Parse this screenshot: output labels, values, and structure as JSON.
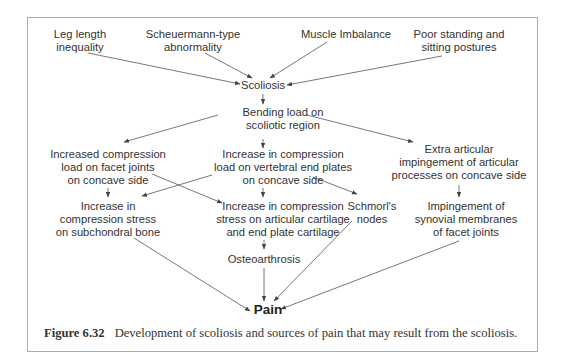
{
  "figure": {
    "caption_label": "Figure 6.32",
    "caption_text": "Development of scoliosis and sources of pain that may result from the scoliosis.",
    "border_color": "#a9a9cf",
    "text_color": "#333333"
  },
  "nodes": {
    "leg_length": [
      "Leg length",
      "inequality"
    ],
    "scheuermann": [
      "Scheuermann-type",
      "abnormality"
    ],
    "muscle_imbalance": [
      "Muscle Imbalance"
    ],
    "poor_posture": [
      "Poor standing and",
      "sitting postures"
    ],
    "scoliosis": [
      "Scoliosis"
    ],
    "bending_load": [
      "Bending load on",
      "scoliotic region"
    ],
    "facet_compression": [
      "Increased compression",
      "load on facet joints",
      "on concave side"
    ],
    "endplate_compression": [
      "Increase in compression",
      "load on vertebral end plates",
      "on concave side"
    ],
    "extra_articular": [
      "Extra articular",
      "impingement of articular",
      "processes on concave side"
    ],
    "subchondral_stress": [
      "Increase in",
      "compression stress",
      "on subchondral bone"
    ],
    "cartilage_stress": [
      "Increase in compression",
      "stress on articular  cartilage",
      "and end plate cartilage"
    ],
    "schmorl": [
      "Schmorl's",
      "nodes"
    ],
    "synovial_impingement": [
      "Impingement of",
      "synovial membranes",
      "of facet joints"
    ],
    "osteoarthrosis": [
      "Osteoarthrosis"
    ],
    "pain": [
      "Pain"
    ]
  },
  "edges": [
    {
      "from": "Leg length inequality",
      "to": "Scoliosis"
    },
    {
      "from": "Scheuermann-type abnormality",
      "to": "Scoliosis"
    },
    {
      "from": "Muscle Imbalance",
      "to": "Scoliosis"
    },
    {
      "from": "Poor standing and sitting postures",
      "to": "Scoliosis"
    },
    {
      "from": "Scoliosis",
      "to": "Bending load on scoliotic region"
    },
    {
      "from": "Bending load on scoliotic region",
      "to": "Increased compression load on facet joints on concave side"
    },
    {
      "from": "Bending load on scoliotic region",
      "to": "Increase in compression load on vertebral end plates on concave side"
    },
    {
      "from": "Bending load on scoliotic region",
      "to": "Extra articular impingement of articular processes on concave side"
    },
    {
      "from": "Increased compression load on facet joints on concave side",
      "to": "Increase in compression stress on subchondral bone"
    },
    {
      "from": "Increased compression load on facet joints on concave side",
      "to": "Increase in compression stress on articular cartilage and end plate cartilage"
    },
    {
      "from": "Increase in compression load on vertebral end plates on concave side",
      "to": "Increase in compression stress on subchondral bone"
    },
    {
      "from": "Increase in compression load on vertebral end plates on concave side",
      "to": "Increase in compression stress on articular cartilage and end plate cartilage"
    },
    {
      "from": "Increase in compression load on vertebral end plates on concave side",
      "to": "Schmorl's nodes"
    },
    {
      "from": "Extra articular impingement of articular processes on concave side",
      "to": "Impingement of synovial membranes of facet joints"
    },
    {
      "from": "Increase in compression stress on articular cartilage and end plate cartilage",
      "to": "Osteoarthrosis"
    },
    {
      "from": "Increase in compression stress on subchondral bone",
      "to": "Pain"
    },
    {
      "from": "Osteoarthrosis",
      "to": "Pain"
    },
    {
      "from": "Schmorl's nodes",
      "to": "Pain"
    },
    {
      "from": "Impingement of synovial membranes of facet joints",
      "to": "Pain"
    }
  ]
}
